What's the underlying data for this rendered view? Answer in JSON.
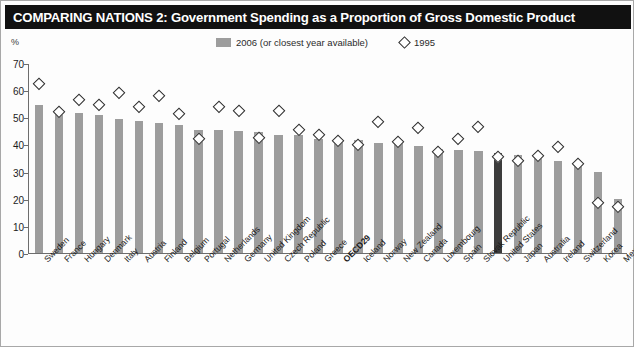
{
  "header": {
    "title": "COMPARING NATIONS 2: Government Spending as a Proportion of Gross Domestic Product",
    "unit_label": "%"
  },
  "legend": {
    "series_bar_label": "2006 (or closest year available)",
    "series_marker_label": "1995"
  },
  "colors": {
    "title_bar": "#111111",
    "bar": "#9d9d9d",
    "bar_highlight": "#3c3c3c",
    "marker_stroke": "#2e2e2e",
    "axis": "#6d6d6d"
  },
  "chart_data": {
    "type": "bar",
    "title": "COMPARING NATIONS 2: Government Spending as a Proportion of Gross Domestic Product",
    "xlabel": "",
    "ylabel": "%",
    "ylim": [
      0,
      70
    ],
    "yticks": [
      0,
      10,
      20,
      30,
      40,
      50,
      60,
      70
    ],
    "grid": false,
    "legend_position": "top-center",
    "highlight_category": "United States",
    "bold_category": "OECD29",
    "categories": [
      "Sweden",
      "France",
      "Hungary",
      "Denmark",
      "Italy",
      "Austria",
      "Finland",
      "Belgium",
      "Portugal",
      "Netherlands",
      "Germany",
      "United Kingdom",
      "Czech Republic",
      "Poland",
      "Greece",
      "OECD29",
      "Iceland",
      "Norway",
      "New Zealand",
      "Canada",
      "Luxembourg",
      "Spain",
      "Slovak Republic",
      "United States",
      "Japan",
      "Australia",
      "Ireland",
      "Switzerland",
      "Korea",
      "Mexico"
    ],
    "series": [
      {
        "name": "2006 (or closest year available)",
        "type": "bar",
        "values": [
          54.5,
          51.5,
          51.5,
          51.0,
          49.5,
          48.5,
          48.0,
          47.0,
          45.5,
          45.5,
          45.0,
          44.5,
          43.5,
          43.5,
          42.0,
          41.5,
          41.5,
          40.5,
          40.5,
          39.5,
          38.5,
          38.0,
          37.5,
          37.0,
          36.0,
          35.0,
          34.0,
          34.0,
          30.0,
          20.0
        ]
      },
      {
        "name": "1995",
        "type": "scatter",
        "values": [
          64.5,
          54.0,
          58.5,
          56.5,
          61.0,
          56.0,
          60.0,
          53.5,
          44.0,
          56.0,
          54.5,
          44.5,
          54.5,
          47.5,
          45.5,
          43.5,
          42.0,
          50.5,
          43.0,
          48.0,
          39.5,
          44.0,
          48.5,
          37.5,
          36.0,
          38.0,
          41.0,
          35.0,
          20.5,
          19.0
        ]
      }
    ]
  }
}
